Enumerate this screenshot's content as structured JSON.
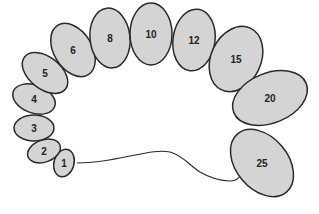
{
  "diagram": {
    "colors": {
      "fill": "#d4d4d4",
      "stroke": "#2a2a2a",
      "label": "#222222",
      "background": "#ffffff"
    },
    "segments": [
      {
        "label": "1",
        "cx": 64,
        "cy": 163,
        "rx": 10,
        "ry": 14,
        "rot": 15
      },
      {
        "label": "2",
        "cx": 44,
        "cy": 151,
        "rx": 17,
        "ry": 11,
        "rot": -20
      },
      {
        "label": "3",
        "cx": 34,
        "cy": 128,
        "rx": 20,
        "ry": 13,
        "rot": 0
      },
      {
        "label": "4",
        "cx": 34,
        "cy": 99,
        "rx": 22,
        "ry": 14,
        "rot": 20
      },
      {
        "label": "5",
        "cx": 45,
        "cy": 73,
        "rx": 26,
        "ry": 16,
        "rot": 38
      },
      {
        "label": "6",
        "cx": 73,
        "cy": 50,
        "rx": 19,
        "ry": 29,
        "rot": -32
      },
      {
        "label": "8",
        "cx": 110,
        "cy": 38,
        "rx": 20,
        "ry": 30,
        "rot": -6
      },
      {
        "label": "10",
        "cx": 151,
        "cy": 34,
        "rx": 21,
        "ry": 31,
        "rot": 0
      },
      {
        "label": "12",
        "cx": 194,
        "cy": 40,
        "rx": 21,
        "ry": 31,
        "rot": 8
      },
      {
        "label": "15",
        "cx": 236,
        "cy": 59,
        "rx": 25,
        "ry": 34,
        "rot": 25
      },
      {
        "label": "20",
        "cx": 270,
        "cy": 98,
        "rx": 39,
        "ry": 25,
        "rot": -22
      },
      {
        "label": "25",
        "cx": 262,
        "cy": 163,
        "rx": 38,
        "ry": 26,
        "rot": 50
      }
    ],
    "connector": {
      "from": "1",
      "to": "25",
      "path": "M 77 163 C 95 163, 110 160, 130 156 C 150 152, 160 150, 170 152 C 182 155, 188 164, 200 172 C 212 179, 222 181, 230 181 C 236 181, 238 179, 240 176"
    }
  }
}
